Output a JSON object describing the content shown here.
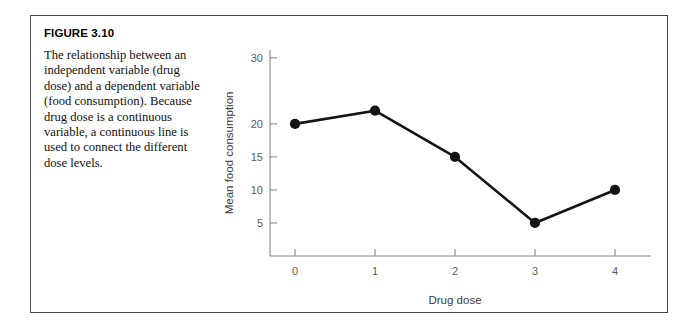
{
  "figure": {
    "number_label": "FIGURE 3.10",
    "caption": "The relationship between an independent variable (drug dose) and a dependent variable (food consumption). Because drug dose is a continuous variable, a continuous line is used to connect the different dose levels."
  },
  "chart_data": {
    "type": "line",
    "title": "",
    "xlabel": "Drug dose",
    "ylabel": "Mean food consumption",
    "x": [
      0,
      1,
      2,
      3,
      4
    ],
    "categories": [
      "0",
      "1",
      "2",
      "3",
      "4"
    ],
    "values": [
      20,
      22,
      15,
      5,
      10
    ],
    "series": [
      {
        "name": "Mean food consumption",
        "values": [
          20,
          22,
          15,
          5,
          10
        ]
      }
    ],
    "xtick_labels": [
      "0",
      "1",
      "2",
      "3",
      "4"
    ],
    "ytick_labels": [
      "5",
      "10",
      "15",
      "20",
      "30"
    ],
    "ytick_values": [
      5,
      10,
      15,
      20,
      30
    ],
    "xlim": [
      -0.45,
      4.45
    ],
    "ylim": [
      0,
      33
    ],
    "grid": false,
    "legend": false,
    "marker": "filled-circle",
    "line_color": "#141414",
    "marker_color": "#141414",
    "axis_color": "#8a8a8a"
  }
}
